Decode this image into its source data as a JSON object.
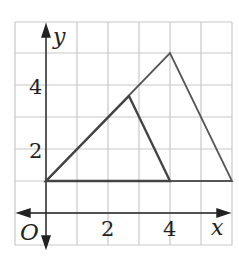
{
  "diagram": {
    "type": "coordinate-plane",
    "axes": {
      "x_label": "x",
      "y_label": "y",
      "origin_label": "O"
    },
    "x_ticks": [
      {
        "value": 2,
        "label": "2"
      },
      {
        "value": 4,
        "label": "4"
      }
    ],
    "y_ticks": [
      {
        "value": 2,
        "label": "2"
      },
      {
        "value": 4,
        "label": "4"
      }
    ],
    "grid": {
      "x_range": [
        -1,
        6
      ],
      "y_range": [
        -1,
        6
      ]
    },
    "shapes": [
      {
        "name": "large-triangle",
        "vertices": [
          [
            0,
            1
          ],
          [
            4,
            5
          ],
          [
            6,
            1
          ]
        ]
      },
      {
        "name": "small-triangle",
        "vertices": [
          [
            0,
            1
          ],
          [
            2.67,
            3.67
          ],
          [
            4,
            1
          ]
        ]
      }
    ],
    "colors": {
      "grid": "#c8c8c8",
      "axis": "#222222",
      "triangle": "#555555"
    }
  }
}
